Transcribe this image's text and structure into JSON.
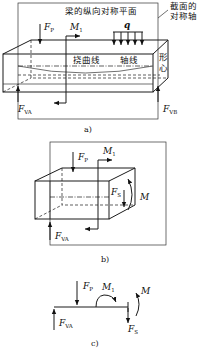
{
  "figure": {
    "panel_a": {
      "caption": "a)",
      "labels": {
        "plane": "梁的纵向对称平面",
        "axis_of_symmetry_line1": "截面的",
        "axis_of_symmetry_line2": "对称轴",
        "deflection_curve": "挠曲线",
        "axis_line": "轴线",
        "centroid_line1": "形",
        "centroid_line2": "心"
      },
      "forces": {
        "fp": {
          "symbol": "F",
          "sub": "P"
        },
        "m1": {
          "symbol": "M",
          "sub": "1"
        },
        "q": {
          "symbol": "q"
        },
        "fva": {
          "symbol": "F",
          "sub": "VA"
        },
        "fvb": {
          "symbol": "F",
          "sub": "VB"
        }
      }
    },
    "panel_b": {
      "caption": "b)",
      "forces": {
        "fp": {
          "symbol": "F",
          "sub": "P"
        },
        "m1": {
          "symbol": "M",
          "sub": "1"
        },
        "fs": {
          "symbol": "F",
          "sub": "S"
        },
        "m": {
          "symbol": "M"
        },
        "fva": {
          "symbol": "F",
          "sub": "VA"
        }
      }
    },
    "panel_c": {
      "caption": "c)",
      "forces": {
        "fp": {
          "symbol": "F",
          "sub": "P"
        },
        "m1": {
          "symbol": "M",
          "sub": "1"
        },
        "m": {
          "symbol": "M"
        },
        "fs": {
          "symbol": "F",
          "sub": "S"
        },
        "fva": {
          "symbol": "F",
          "sub": "VA"
        }
      }
    }
  }
}
